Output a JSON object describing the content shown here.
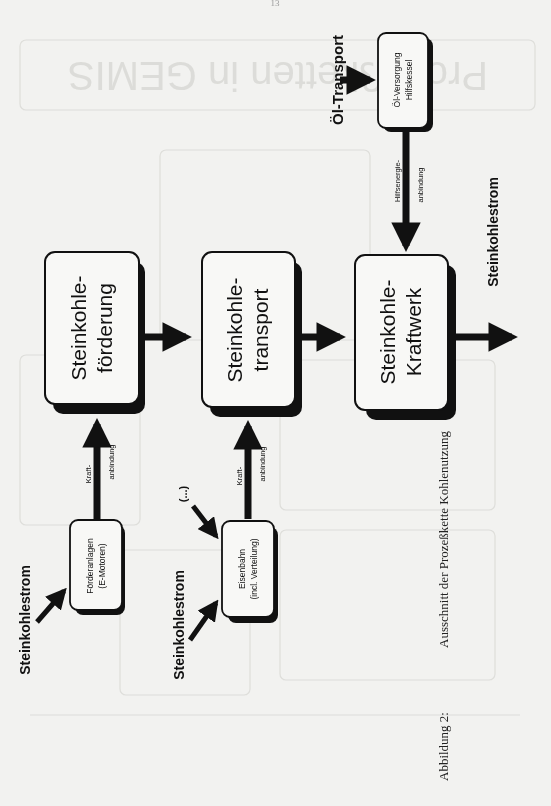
{
  "page": {
    "number": "13"
  },
  "diagram": {
    "boxes": {
      "foerderung": {
        "line1": "Steinkohle-",
        "line2": "förderung"
      },
      "transport": {
        "line1": "Steinkohle-",
        "line2": "transport"
      },
      "kraftwerk": {
        "line1": "Steinkohle-",
        "line2": "Kraftwerk"
      },
      "oelversorgung": {
        "line1": "Öl-Versorgung",
        "line2": "Hilfskessel"
      },
      "foerderanlagen": {
        "line1": "Förderanlagen",
        "line2": "(E-Motoren)"
      },
      "eisenbahn": {
        "line1": "Eisenbahn",
        "line2": "(incl. Verteilung)"
      }
    },
    "labels": {
      "oel_transport": "Öl-Transport",
      "output_strom": "Steinkohlestrom",
      "input_strom_1": "Steinkohlestrom",
      "input_strom_2": "Steinkohlestrom",
      "ellipsis": "(...)",
      "kraft_1_line1": "Kraft-",
      "kraft_1_line2": "anbindung",
      "kraft_2_line1": "Kraft-",
      "kraft_2_line2": "anbindung",
      "hilfs_line1": "Hilfsenergie-",
      "hilfs_line2": "anbindung"
    }
  },
  "caption": {
    "label": "Abbildung 2:",
    "text": "Ausschnitt der Prozeßkette Kohlenutzung"
  },
  "background_ghost": {
    "title": "Prozeßketten in GEMIS"
  }
}
